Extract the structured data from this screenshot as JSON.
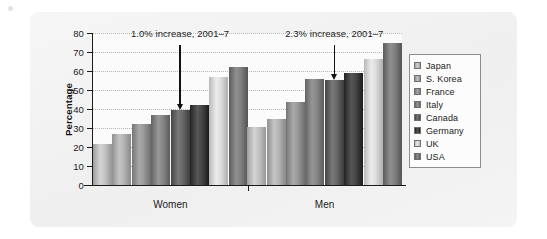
{
  "chart_data": {
    "type": "bar",
    "title": "",
    "xlabel": "",
    "ylabel": "Percentage",
    "ylim": [
      0,
      80
    ],
    "ytick_step": 10,
    "yticks": [
      80,
      70,
      60,
      50,
      40,
      30,
      20,
      10,
      0
    ],
    "grid": true,
    "legend_position": "right",
    "categories": [
      "Women",
      "Men"
    ],
    "series": [
      {
        "name": "Japan",
        "color": "#b9b9b9",
        "values": [
          21.5,
          30.5
        ]
      },
      {
        "name": "S. Korea",
        "color": "#aaaaaa",
        "values": [
          27.0,
          35.0
        ]
      },
      {
        "name": "France",
        "color": "#8f8f8f",
        "values": [
          32.0,
          43.5
        ]
      },
      {
        "name": "Italy",
        "color": "#7d7d7d",
        "values": [
          37.0,
          56.0
        ]
      },
      {
        "name": "Canada",
        "color": "#5e5e5e",
        "values": [
          39.5,
          55.5
        ]
      },
      {
        "name": "Germany",
        "color": "#3d3d3d",
        "values": [
          42.0,
          59.0
        ]
      },
      {
        "name": "UK",
        "color": "#d2d2d2",
        "values": [
          57.0,
          66.5
        ]
      },
      {
        "name": "USA",
        "color": "#767676",
        "values": [
          62.0,
          75.0
        ]
      }
    ],
    "annotations": [
      {
        "text": "1.0% increase, 2001–7",
        "group": "Women",
        "points_to_series": "Canada"
      },
      {
        "text": "2.3% increase, 2001–7",
        "group": "Men",
        "points_to_series": "Canada"
      }
    ]
  },
  "legend": {
    "items": [
      {
        "label": "Japan"
      },
      {
        "label": "S. Korea"
      },
      {
        "label": "France"
      },
      {
        "label": "Italy"
      },
      {
        "label": "Canada"
      },
      {
        "label": "Germany"
      },
      {
        "label": "UK"
      },
      {
        "label": "USA"
      }
    ]
  },
  "colors": {
    "panel": "#f2f2f2",
    "plot_background": "#fbfbfb",
    "axis": "#1a1a1a",
    "gridline": "#b4b4b4",
    "annotation": "#111111"
  }
}
